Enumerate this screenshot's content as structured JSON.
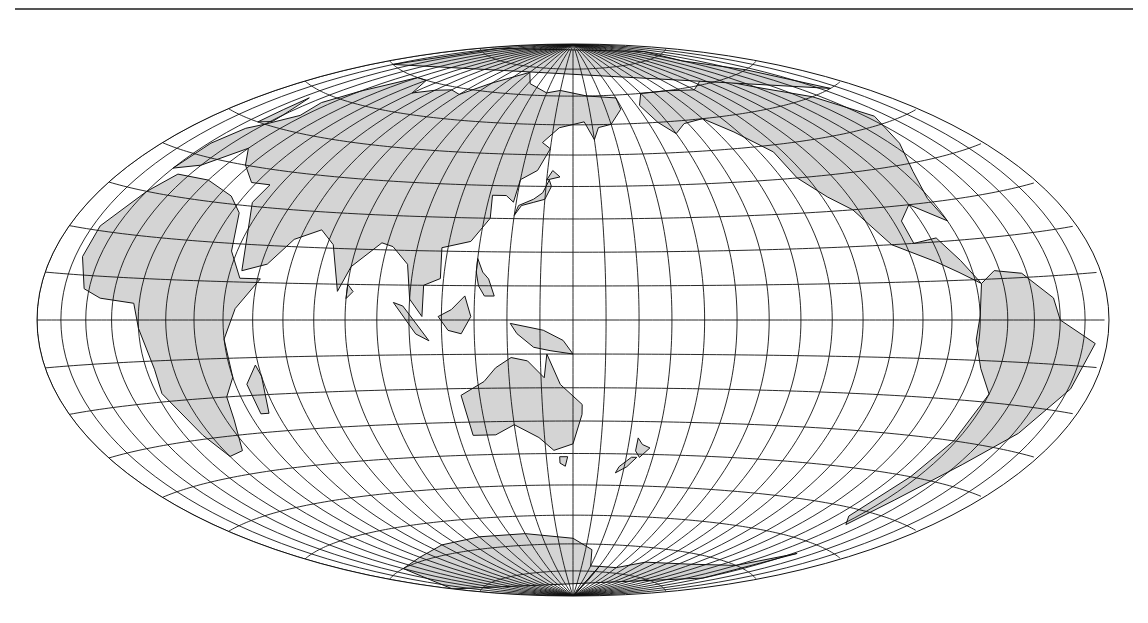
{
  "map": {
    "projection": "Hammer equal-area",
    "central_meridian_deg": 150,
    "graticule_step_deg": 10,
    "colors": {
      "land": "#d4d4d4",
      "ocean": "#ffffff",
      "grid": "#111111",
      "coast": "#111111",
      "rule": "#555555"
    },
    "ellipse": {
      "cx": 573,
      "cy": 320,
      "rx": 536,
      "ry": 276
    }
  }
}
